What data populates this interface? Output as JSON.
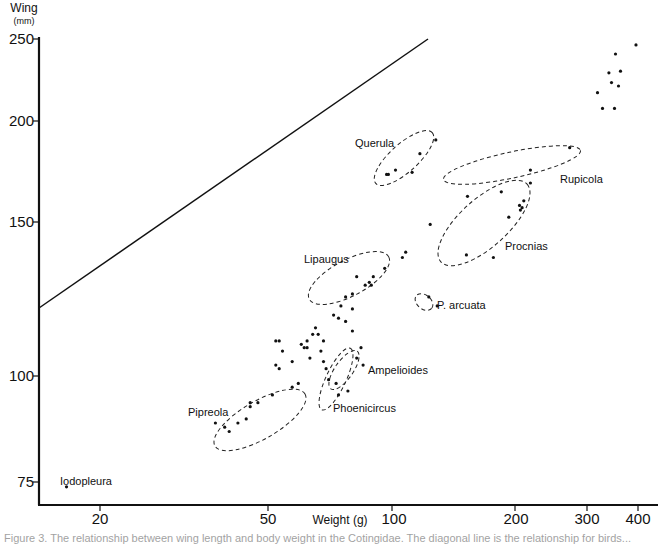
{
  "chart_data": {
    "type": "scatter",
    "title": "",
    "xlabel": "Weight",
    "xlabel_unit": "(g)",
    "ylabel": "Wing",
    "ylabel_unit": "(mm)",
    "xscale": "log",
    "yscale": "log",
    "xlim": [
      15,
      440
    ],
    "ylim": [
      72,
      252
    ],
    "xticks": [
      20,
      50,
      100,
      200,
      300,
      400
    ],
    "yticks": [
      75,
      100,
      150,
      200,
      250
    ],
    "grid": false,
    "legend": "none",
    "reference_line": {
      "from": [
        15,
        122
      ],
      "to": [
        125,
        250
      ],
      "note": "solid diagonal line"
    },
    "groups": [
      {
        "name": "Querula",
        "points": [
          [
            97,
            173
          ],
          [
            98,
            173
          ],
          [
            102,
            175
          ],
          [
            112,
            174
          ],
          [
            117,
            183
          ],
          [
            128,
            190
          ]
        ]
      },
      {
        "name": "Rupicola",
        "points": [
          [
            153,
            163
          ],
          [
            218,
            169
          ],
          [
            218,
            175
          ],
          [
            272,
            186
          ]
        ]
      },
      {
        "name": "Procnias",
        "points": [
          [
            152,
            139
          ],
          [
            177,
            138
          ],
          [
            185,
            165
          ],
          [
            205,
            159
          ],
          [
            208,
            158
          ],
          [
            206,
            157
          ],
          [
            210,
            161
          ],
          [
            193,
            154
          ]
        ]
      },
      {
        "name": "Lipaugus",
        "points": [
          [
            77,
            124
          ],
          [
            80,
            125
          ],
          [
            82,
            131
          ],
          [
            88,
            129
          ],
          [
            89,
            128
          ],
          [
            86,
            128
          ],
          [
            90,
            131
          ],
          [
            96,
            134
          ],
          [
            106,
            138
          ],
          [
            108,
            140
          ]
        ]
      },
      {
        "name": "P. arcuata",
        "points": [
          [
            123,
            124
          ],
          [
            129,
            121
          ]
        ]
      },
      {
        "name": "Ampelioides",
        "points": [
          [
            82,
            105
          ],
          [
            85,
            103
          ],
          [
            84,
            108
          ]
        ]
      },
      {
        "name": "Phoenicircus",
        "points": [
          [
            73,
            98
          ],
          [
            74,
            95
          ],
          [
            78,
            96
          ]
        ]
      },
      {
        "name": "Pipreola",
        "points": [
          [
            37,
            88
          ],
          [
            39,
            87
          ],
          [
            40,
            86
          ],
          [
            42,
            88
          ],
          [
            44,
            89
          ],
          [
            45,
            92
          ],
          [
            45,
            93
          ],
          [
            47,
            93
          ],
          [
            51,
            95
          ],
          [
            57,
            97
          ],
          [
            59,
            98
          ]
        ]
      },
      {
        "name": "Iodopleura",
        "points": [
          [
            16,
            74
          ]
        ]
      }
    ],
    "ungrouped_points": [
      [
        52,
        110
      ],
      [
        53,
        110
      ],
      [
        54,
        107
      ],
      [
        52,
        103
      ],
      [
        53,
        102
      ],
      [
        57,
        104
      ],
      [
        61,
        108
      ],
      [
        62,
        108
      ],
      [
        63,
        105
      ],
      [
        60,
        109
      ],
      [
        62,
        110
      ],
      [
        64,
        112
      ],
      [
        66,
        112
      ],
      [
        65,
        114
      ],
      [
        68,
        110
      ],
      [
        67,
        107
      ],
      [
        68,
        104
      ],
      [
        69,
        102
      ],
      [
        70,
        99
      ],
      [
        72,
        118
      ],
      [
        74,
        117
      ],
      [
        75,
        121
      ],
      [
        80,
        120
      ],
      [
        77,
        116
      ],
      [
        80,
        113
      ],
      [
        124,
        151
      ]
    ],
    "top_right_cluster": [
      [
        318,
        216
      ],
      [
        327,
        207
      ],
      [
        339,
        228
      ],
      [
        344,
        222
      ],
      [
        350,
        207
      ],
      [
        352,
        240
      ],
      [
        358,
        220
      ],
      [
        362,
        229
      ],
      [
        395,
        246
      ]
    ]
  },
  "axes": {
    "y_title": "Wing",
    "y_unit": "(mm)",
    "x_title": "Weight (g)",
    "y_tick_labels": [
      "250",
      "200",
      "150",
      "100",
      "75"
    ],
    "x_tick_labels": [
      "20",
      "50",
      "100",
      "200",
      "300",
      "400"
    ]
  },
  "labels": {
    "querula": "Querula",
    "rupicola": "Rupicola",
    "procnias": "Procnias",
    "lipaugus": "Lipaugus",
    "parcuata": "P. arcuata",
    "ampelioides": "Ampelioides",
    "phoenicircus": "Phoenicircus",
    "pipreola": "Pipreola",
    "iodopleura": "Iodopleura"
  },
  "caption": "Figure 3.  The relationship between wing length and body weight in the Cotingidae. The diagonal line is the relationship for birds..."
}
